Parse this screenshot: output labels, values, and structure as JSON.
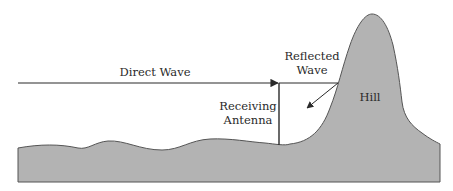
{
  "diagram": {
    "type": "multipath-propagation",
    "labels": {
      "direct_wave": "Direct Wave",
      "reflected_wave_line1": "Reflected",
      "reflected_wave_line2": "Wave",
      "receiving_antenna_line1": "Receiving",
      "receiving_antenna_line2": "Antenna",
      "hill": "Hill"
    },
    "colors": {
      "terrain_fill": "#b3b3b3",
      "terrain_stroke": "#555555",
      "line": "#2a2a2a",
      "background": "#ffffff"
    }
  }
}
